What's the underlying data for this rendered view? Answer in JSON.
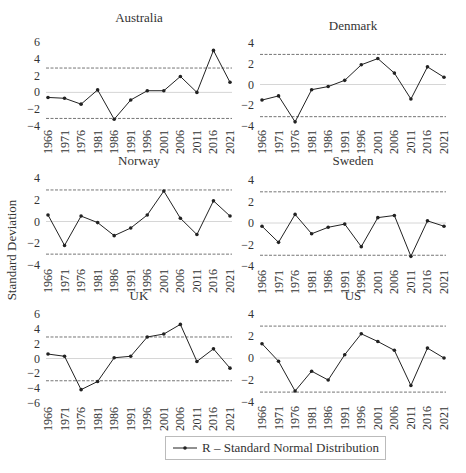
{
  "figure": {
    "ylabel": "Standard Deviation",
    "legend_label": "R – Standard Normal Distribution",
    "colors": {
      "line": "#222222",
      "threshold": "#666666",
      "zero": "#cccccc",
      "text": "#333333"
    }
  },
  "chart_data": [
    {
      "type": "line",
      "title": "Australia",
      "x": [
        "1966",
        "1971",
        "1976",
        "1981",
        "1986",
        "1991",
        "1996",
        "2001",
        "2006",
        "2011",
        "2016",
        "2021"
      ],
      "values": [
        -0.6,
        -0.7,
        -1.4,
        0.3,
        -3.2,
        -0.9,
        0.2,
        0.2,
        1.9,
        0.0,
        5.0,
        1.2
      ],
      "thresholds": [
        2.9,
        -3.1
      ],
      "ylim": [
        -4,
        6
      ],
      "yticks": [
        6,
        4,
        2,
        0,
        -2,
        -4
      ],
      "xlabel": "",
      "ylabel": "Standard Deviation",
      "grid": false
    },
    {
      "type": "line",
      "title": "Denmark",
      "x": [
        "1966",
        "1971",
        "1976",
        "1981",
        "1986",
        "1991",
        "1996",
        "2001",
        "2006",
        "2011",
        "2016",
        "2021"
      ],
      "values": [
        -1.5,
        -1.1,
        -3.6,
        -0.5,
        -0.2,
        0.4,
        1.9,
        2.5,
        1.1,
        -1.4,
        1.7,
        0.7
      ],
      "thresholds": [
        2.9,
        -3.1
      ],
      "ylim": [
        -4,
        4
      ],
      "yticks": [
        4,
        2,
        0,
        -2,
        -4
      ],
      "xlabel": "",
      "ylabel": "Standard Deviation",
      "grid": false
    },
    {
      "type": "line",
      "title": "Norway",
      "x": [
        "1966",
        "1971",
        "1976",
        "1981",
        "1986",
        "1991",
        "1996",
        "2001",
        "2006",
        "2011",
        "2016",
        "2021"
      ],
      "values": [
        0.6,
        -2.2,
        0.5,
        -0.1,
        -1.3,
        -0.6,
        0.6,
        2.8,
        0.3,
        -1.2,
        1.9,
        0.5
      ],
      "thresholds": [
        2.9,
        -3.0
      ],
      "ylim": [
        -4,
        4
      ],
      "yticks": [
        4,
        2,
        0,
        -2,
        -4
      ],
      "xlabel": "",
      "ylabel": "Standard Deviation",
      "grid": false
    },
    {
      "type": "line",
      "title": "Sweden",
      "x": [
        "1966",
        "1971",
        "1976",
        "1981",
        "1986",
        "1991",
        "1996",
        "2001",
        "2006",
        "2011",
        "2016",
        "2021"
      ],
      "values": [
        -0.3,
        -1.8,
        0.8,
        -1.0,
        -0.4,
        -0.1,
        -2.2,
        0.5,
        0.7,
        -3.1,
        0.2,
        -0.3
      ],
      "thresholds": [
        2.9,
        -3.0
      ],
      "ylim": [
        -4,
        4
      ],
      "yticks": [
        4,
        2,
        0,
        -2,
        -4
      ],
      "xlabel": "",
      "ylabel": "Standard Deviation",
      "grid": false
    },
    {
      "type": "line",
      "title": "UK",
      "x": [
        "1966",
        "1971",
        "1976",
        "1981",
        "1986",
        "1991",
        "1996",
        "2001",
        "2006",
        "2011",
        "2016",
        "2021"
      ],
      "values": [
        0.6,
        0.3,
        -4.2,
        -3.1,
        0.1,
        0.3,
        2.9,
        3.3,
        4.6,
        -0.4,
        1.3,
        -1.3
      ],
      "thresholds": [
        2.9,
        -3.0
      ],
      "ylim": [
        -6,
        6
      ],
      "yticks": [
        6,
        4,
        2,
        0,
        -2,
        -4,
        -6
      ],
      "xlabel": "",
      "ylabel": "Standard Deviation",
      "grid": false
    },
    {
      "type": "line",
      "title": "US",
      "x": [
        "1966",
        "1971",
        "1976",
        "1981",
        "1986",
        "1991",
        "1996",
        "2001",
        "2006",
        "2011",
        "2016",
        "2021"
      ],
      "values": [
        1.3,
        -0.3,
        -3.0,
        -1.2,
        -2.0,
        0.3,
        2.2,
        1.5,
        0.7,
        -2.5,
        0.9,
        0.0
      ],
      "thresholds": [
        2.9,
        -3.1
      ],
      "ylim": [
        -4,
        4
      ],
      "yticks": [
        4,
        2,
        0,
        -2,
        -4
      ],
      "xlabel": "",
      "ylabel": "Standard Deviation",
      "grid": false
    }
  ]
}
